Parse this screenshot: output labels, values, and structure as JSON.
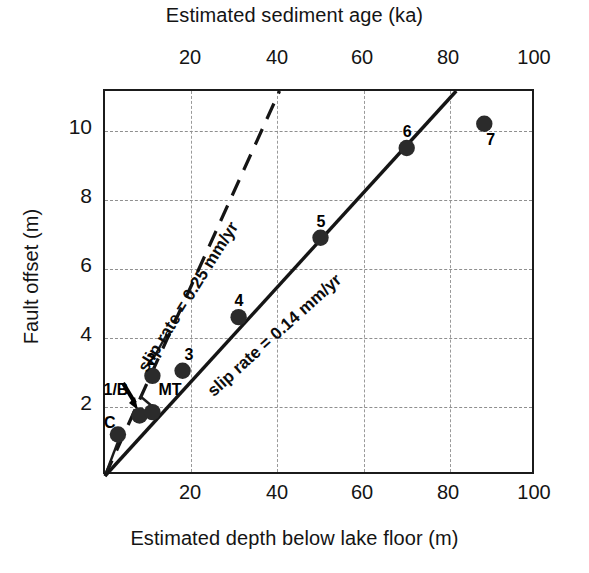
{
  "chart_data": {
    "type": "scatter",
    "title": "",
    "xlabel": "Estimated depth below lake floor (m)",
    "ylabel": "Fault offset (m)",
    "x2label": "Estimated sediment age (ka)",
    "xlim": [
      0,
      100
    ],
    "ylim": [
      0,
      11.15
    ],
    "x2lim": [
      0,
      100
    ],
    "xticks": [
      20,
      40,
      60,
      80,
      100
    ],
    "x2ticks": [
      20,
      40,
      60,
      80,
      100
    ],
    "yticks": [
      2,
      4,
      6,
      8,
      10
    ],
    "grid": true,
    "legend": "none",
    "points": [
      {
        "label": "C",
        "x": 3,
        "y": 1.2,
        "label_dx": -14,
        "label_dy": -20
      },
      {
        "label": "1/B",
        "x": 8,
        "y": 1.75,
        "label_dx": -36,
        "label_dy": -34
      },
      {
        "label": "MT",
        "x": 11,
        "y": 1.85,
        "label_dx": 6,
        "label_dy": -30
      },
      {
        "label": "2",
        "x": 11,
        "y": 2.9,
        "label_dx": -6,
        "label_dy": -24
      },
      {
        "label": "3",
        "x": 18,
        "y": 3.05,
        "label_dx": 2,
        "label_dy": -24
      },
      {
        "label": "4",
        "x": 31,
        "y": 4.6,
        "label_dx": -4,
        "label_dy": -24
      },
      {
        "label": "5",
        "x": 50,
        "y": 6.9,
        "label_dx": -4,
        "label_dy": -24
      },
      {
        "label": "6",
        "x": 70,
        "y": 9.5,
        "label_dx": -4,
        "label_dy": -24
      },
      {
        "label": "7",
        "x": 88,
        "y": 10.2,
        "label_dx": 2,
        "label_dy": 8
      }
    ],
    "trend_lines": [
      {
        "name": "slip rate = 0.14 mm/yr",
        "annotation": "slip rate = 0.14 mm/yr",
        "style": "solid",
        "slope": 0.14,
        "from": [
          0,
          0
        ],
        "to": [
          81.5,
          11.15
        ]
      },
      {
        "name": "slip rate = 0.25 mm/yr",
        "annotation": "slip rate = 0.25 mm/yr",
        "style": "dashed",
        "slope": 0.25,
        "from": [
          0,
          0
        ],
        "to": [
          40.5,
          11.15
        ]
      }
    ],
    "arrow_annotations": [
      {
        "name": "one-b-pointer",
        "from": [
          6.0,
          2.55
        ],
        "to": [
          7.2,
          1.95
        ]
      }
    ],
    "leader_lines": [
      {
        "name": "c-leader",
        "from": [
          0.2,
          0.1
        ],
        "to": [
          3.2,
          1.05
        ]
      },
      {
        "name": "mt-leader",
        "from": [
          8.0,
          2.35
        ],
        "to": [
          11.0,
          2.0
        ]
      }
    ]
  },
  "labels": {
    "top_axis_title": "Estimated sediment age (ka)",
    "bottom_axis_title": "Estimated depth below lake floor (m)",
    "left_axis_title": "Fault offset (m)",
    "top_ticks": [
      "20",
      "40",
      "60",
      "80",
      "100"
    ],
    "bottom_ticks": [
      "20",
      "40",
      "60",
      "80",
      "100"
    ],
    "left_ticks": [
      "10",
      "8",
      "6",
      "4",
      "2"
    ],
    "slip_025": "slip rate = 0.25 mm/yr",
    "slip_014": "slip rate = 0.14 mm/yr",
    "pt_c": "C",
    "pt_1b": "1/B",
    "pt_mt": "MT",
    "pt_2": "2",
    "pt_3": "3",
    "pt_4": "4",
    "pt_5": "5",
    "pt_6": "6",
    "pt_7": "7"
  },
  "colors": {
    "marker": "#2b2b2b",
    "axis": "#1b1b1b",
    "grid": "#949494",
    "text": "#141414"
  }
}
